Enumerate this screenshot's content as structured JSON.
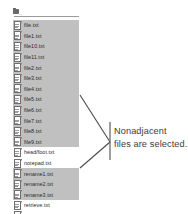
{
  "window": {
    "title": "File list with nonadjacent selection"
  },
  "file_list": {
    "parent_entry": {
      "label": "..",
      "icon": "folder-up-icon"
    },
    "items": [
      {
        "name": "file.txt",
        "selected": true
      },
      {
        "name": "file1.txt",
        "selected": true
      },
      {
        "name": "file10.txt",
        "selected": true
      },
      {
        "name": "file11.txt",
        "selected": true
      },
      {
        "name": "file2.txt",
        "selected": true
      },
      {
        "name": "file3.txt",
        "selected": true
      },
      {
        "name": "file4.txt",
        "selected": true
      },
      {
        "name": "file5.txt",
        "selected": true
      },
      {
        "name": "file6.txt",
        "selected": true
      },
      {
        "name": "file7.txt",
        "selected": true
      },
      {
        "name": "file8.txt",
        "selected": true
      },
      {
        "name": "file9.txt",
        "selected": true
      },
      {
        "name": "head/foot.txt",
        "selected": false
      },
      {
        "name": "notepad.txt",
        "selected": false
      },
      {
        "name": "rename1.txt",
        "selected": true
      },
      {
        "name": "rename2.txt",
        "selected": true
      },
      {
        "name": "rename3.txt",
        "selected": true
      },
      {
        "name": "retrieve.txt",
        "selected": false
      },
      {
        "name": "search.txt",
        "selected": false
      }
    ]
  },
  "callout": {
    "line1": "Nonadjacent",
    "line2": "files are selected."
  },
  "colors": {
    "selection_background": "#c0c0c0",
    "text": "#2b2b2b",
    "callout_text": "#3c3c3c",
    "leader_line": "#4a4a4a",
    "page_background": "#ffffff"
  }
}
